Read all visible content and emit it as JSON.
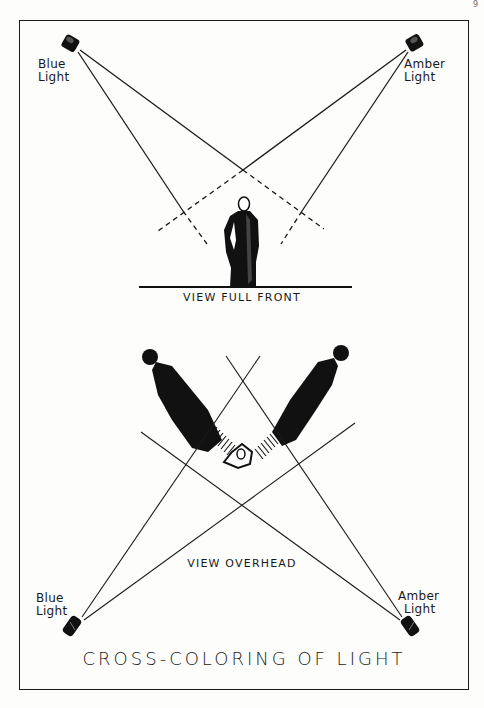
{
  "figure": {
    "title": "CROSS-COLORING OF LIGHT",
    "page_mark": "9"
  },
  "top_view": {
    "caption": "View Full Front",
    "lights": [
      {
        "line1": "Blue",
        "line2": "Light",
        "color_name": "blue",
        "position": "top-left"
      },
      {
        "line1": "Amber",
        "line2": "Light",
        "color_name": "amber",
        "position": "top-right"
      }
    ],
    "subject": "standing robed figure"
  },
  "bottom_view": {
    "caption": "View Overhead",
    "lights": [
      {
        "line1": "Blue",
        "line2": "Light",
        "color_name": "blue",
        "position": "bottom-left"
      },
      {
        "line1": "Amber",
        "line2": "Light",
        "color_name": "amber",
        "position": "bottom-right"
      }
    ],
    "subject": "figure seen from above casting two shadows"
  },
  "colors": {
    "ink": "#1a1a1a",
    "paper": "#fdfdfb"
  }
}
